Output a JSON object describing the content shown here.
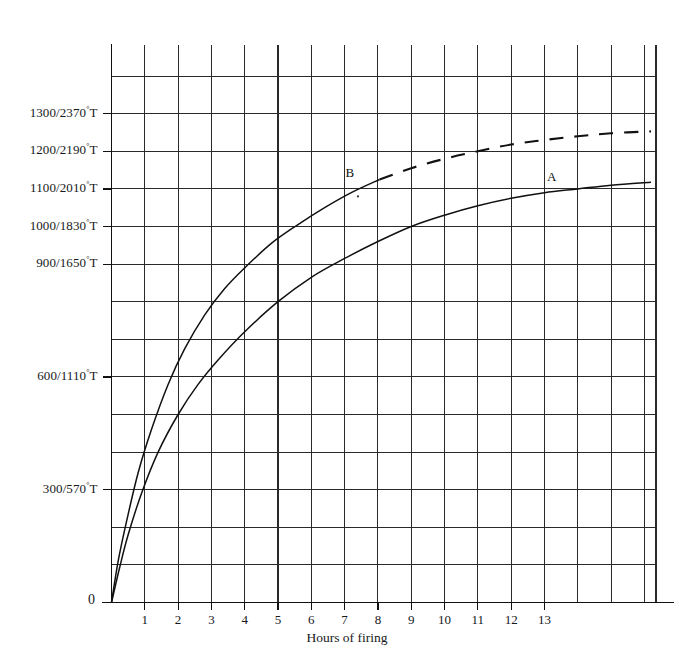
{
  "chart_data": {
    "type": "line",
    "title": "",
    "xlabel": "Hours of firing",
    "ylabel": "",
    "xlim": [
      0,
      16.35
    ],
    "ylim": [
      0,
      1480
    ],
    "grid": true,
    "legend": "inline-curve-labels",
    "x_ticks": [
      0,
      1,
      2,
      3,
      4,
      5,
      6,
      7,
      8,
      9,
      10,
      11,
      12,
      13
    ],
    "x_tick_labels": [
      "0",
      "1",
      "2",
      "3",
      "4",
      "5",
      "6",
      "7",
      "8",
      "9",
      "10",
      "11",
      "12",
      "13"
    ],
    "y_ticks": [
      300,
      600,
      900,
      1000,
      1100,
      1200,
      1300
    ],
    "y_tick_labels": [
      "300/570°T",
      "600/1110°T",
      "900/1650°T",
      "1000/1830°T",
      "1100/2010°T",
      "1200/2190°T",
      "1300/2370°T"
    ],
    "y_tick_celsius": [
      300,
      600,
      900,
      1000,
      1100,
      1200,
      1300
    ],
    "y_tick_fahrenheit": [
      570,
      1110,
      1650,
      1830,
      2010,
      2190,
      2370
    ],
    "series": [
      {
        "name": "A",
        "label": "A",
        "style": "solid",
        "points_x": [
          0,
          0.25,
          0.5,
          0.9,
          1.4,
          2.0,
          2.6,
          3.2,
          4.0,
          5.0,
          6.0,
          7.0,
          8.0,
          9.0,
          10.0,
          11.0,
          12.0,
          13.0,
          14.0,
          15.0,
          16.2
        ],
        "points_y": [
          0,
          95,
          180,
          290,
          400,
          500,
          580,
          645,
          720,
          800,
          865,
          915,
          960,
          1000,
          1030,
          1055,
          1075,
          1090,
          1100,
          1110,
          1118
        ]
      },
      {
        "name": "B",
        "label": "B",
        "style": "solid",
        "points_x": [
          0,
          0.2,
          0.45,
          0.8,
          1.2,
          1.7,
          2.2,
          2.8,
          3.4,
          4.0,
          4.8,
          5.6,
          6.4,
          7.2,
          8.05
        ],
        "points_y": [
          0,
          110,
          215,
          345,
          460,
          580,
          675,
          765,
          835,
          890,
          955,
          1005,
          1050,
          1090,
          1125
        ]
      },
      {
        "name": "B-extension",
        "label": "",
        "style": "dashed",
        "points_x": [
          8.05,
          9.0,
          10.0,
          11.0,
          12.0,
          13.0,
          14.0,
          15.0,
          16.2
        ],
        "points_y": [
          1125,
          1155,
          1180,
          1200,
          1218,
          1230,
          1240,
          1248,
          1253
        ]
      }
    ],
    "annotations": [
      {
        "text": "B",
        "x": 7.15,
        "y": 1140
      },
      {
        "text": "A",
        "x": 13.2,
        "y": 1128
      }
    ]
  },
  "axis": {
    "origin_label": "0",
    "x_axis_title": "Hours of firing"
  }
}
